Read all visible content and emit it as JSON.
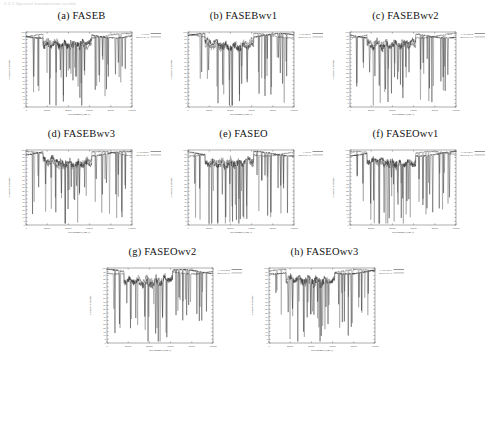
{
  "page_header": "2.2.2  Spectral transmission results",
  "figure": {
    "rows": [
      [
        "a",
        "b",
        "c"
      ],
      [
        "d",
        "e",
        "f"
      ],
      [
        "g",
        "h"
      ]
    ]
  },
  "panels": [
    {
      "id": "a",
      "caption": "(a) FASEB",
      "letter": "(a)",
      "name": "FASEB",
      "legend": [
        {
          "label": "FASEB",
          "color": "#2b2b2b"
        },
        {
          "label": "MODTRAN",
          "color": "#6e6e6e"
        }
      ]
    },
    {
      "id": "b",
      "caption": "(b) FASEBwv1",
      "letter": "(b)",
      "name": "FASEBwv1",
      "legend": [
        {
          "label": "FASEBwv1",
          "color": "#2b2b2b"
        },
        {
          "label": "MODTRAN",
          "color": "#6e6e6e"
        }
      ]
    },
    {
      "id": "c",
      "caption": "(c) FASEBwv2",
      "letter": "(c)",
      "name": "FASEBwv2",
      "legend": [
        {
          "label": "FASEBwv2",
          "color": "#2b2b2b"
        },
        {
          "label": "MODTRAN",
          "color": "#6e6e6e"
        }
      ]
    },
    {
      "id": "d",
      "caption": "(d) FASEBwv3",
      "letter": "(d)",
      "name": "FASEBwv3",
      "legend": [
        {
          "label": "FASEBwv3",
          "color": "#2b2b2b"
        },
        {
          "label": "MODTRAN",
          "color": "#6e6e6e"
        }
      ]
    },
    {
      "id": "e",
      "caption": "(e) FASEO",
      "letter": "(e)",
      "name": "FASEO",
      "legend": [
        {
          "label": "FASEO",
          "color": "#2b2b2b"
        },
        {
          "label": "MODTRAN",
          "color": "#6e6e6e"
        }
      ]
    },
    {
      "id": "f",
      "caption": "(f) FASEOwv1",
      "letter": "(f)",
      "name": "FASEOwv1",
      "legend": [
        {
          "label": "FASEOwv1",
          "color": "#2b2b2b"
        },
        {
          "label": "MODTRAN",
          "color": "#6e6e6e"
        }
      ]
    },
    {
      "id": "g",
      "caption": "(g) FASEOwv2",
      "letter": "(g)",
      "name": "FASEOwv2",
      "legend": [
        {
          "label": "FASEOwv2",
          "color": "#2b2b2b"
        },
        {
          "label": "MODTRAN",
          "color": "#6e6e6e"
        }
      ]
    },
    {
      "id": "h",
      "caption": "(h) FASEOwv3",
      "letter": "(h)",
      "name": "FASEOwv3",
      "legend": [
        {
          "label": "FASEOwv3",
          "color": "#2b2b2b"
        },
        {
          "label": "MODTRAN",
          "color": "#6e6e6e"
        }
      ]
    }
  ],
  "chart_data": [
    {
      "type": "line",
      "panel": "a",
      "title": "(a) FASEB",
      "xlabel": "wavenumber (cm-1)",
      "ylabel": "% correct identified",
      "xlim": [
        0,
        100000
      ],
      "ylim": [
        0,
        100
      ],
      "xticks": [
        0,
        20000,
        40000,
        60000,
        80000,
        100000
      ],
      "xticklabels": [
        "0",
        "20000",
        "40000",
        "60000",
        "80000",
        "100000"
      ],
      "yticks": [
        0,
        5,
        10,
        15,
        20,
        25,
        30,
        35,
        40,
        45,
        50,
        55,
        60,
        65,
        70,
        75,
        80,
        85,
        90,
        95,
        100
      ],
      "yticklabels": [
        "0",
        "5",
        "10",
        "15",
        "20",
        "25",
        "30",
        "35",
        "40",
        "45",
        "50",
        "55",
        "60",
        "65",
        "70",
        "75",
        "80",
        "85",
        "90",
        "95",
        "100"
      ],
      "grid": false,
      "legend_position": "top-right-outside",
      "series": [
        {
          "name": "FASEB",
          "color": "#2b2b2b",
          "x": [
            0,
            1500,
            3000,
            4500,
            6000,
            7000,
            7600,
            8200,
            9000,
            10200,
            11500,
            12600,
            13400,
            14200,
            15000,
            15600,
            16200,
            17000,
            17800,
            18600,
            19400,
            20200,
            21000,
            21800,
            22600,
            23400,
            24200,
            25000,
            25800,
            26600,
            27400,
            28200,
            29000,
            29800,
            30600,
            31400,
            32200,
            33000,
            33800,
            34600,
            35400,
            36200,
            37000,
            37800,
            38600,
            39400,
            40200,
            41000,
            41800,
            42600,
            43400,
            44200,
            45000,
            45800,
            46600,
            47400,
            48200,
            49000,
            49800,
            50600,
            51400,
            52200,
            53000,
            53800,
            54600,
            55400,
            56200,
            57000,
            57800,
            58600,
            59400,
            60200,
            61000,
            61800,
            62600,
            63400,
            64200,
            65000,
            65800,
            66600,
            67400,
            68200,
            69000,
            69800,
            70600,
            71400,
            72200,
            73000,
            73800,
            74600,
            75400,
            76200,
            77000,
            77800,
            78600,
            79400,
            80200,
            81000,
            81800,
            82600,
            83400,
            84200,
            85000,
            85800,
            86600,
            87400,
            88200,
            89000,
            89800,
            90600,
            91400,
            92200,
            93000,
            93800,
            94600,
            95400,
            96200,
            97000,
            97800,
            98600,
            99400,
            100000
          ],
          "y": [
            100,
            99,
            98,
            99,
            97,
            99,
            98,
            99,
            97,
            92,
            98,
            97,
            40,
            71,
            97,
            96,
            68,
            95,
            95,
            96,
            30,
            88,
            93,
            94,
            91,
            88,
            92,
            90,
            86,
            88,
            91,
            89,
            85,
            87,
            90,
            91,
            88,
            90,
            86,
            89,
            91,
            88,
            83,
            90,
            89,
            85,
            62,
            88,
            40,
            86,
            33,
            84,
            55,
            82,
            41,
            80,
            36,
            78,
            49,
            76,
            34,
            80,
            30,
            83,
            45,
            85,
            56,
            84,
            70,
            86,
            80,
            88,
            81,
            84,
            80,
            90,
            92,
            94,
            93,
            95,
            94,
            96,
            95,
            97,
            96,
            97,
            98,
            96,
            97,
            95,
            60,
            92,
            30,
            94,
            38,
            96,
            95,
            97,
            96,
            98,
            97,
            98,
            96,
            97,
            95,
            96,
            94,
            95,
            96,
            97,
            96,
            98,
            97,
            98,
            96,
            97,
            98,
            99,
            98,
            99,
            98,
            99
          ]
        },
        {
          "name": "MODTRAN",
          "color": "#6e6e6e",
          "x": [
            0,
            2000,
            4000,
            6000,
            8000,
            10000,
            12000,
            13400,
            15000,
            16200,
            18000,
            20200,
            22000,
            24000,
            26000,
            28000,
            30000,
            32000,
            34000,
            36000,
            38000,
            40200,
            42000,
            43400,
            45000,
            46600,
            48200,
            50000,
            51400,
            53000,
            54600,
            56200,
            58000,
            60000,
            62000,
            64000,
            66000,
            68000,
            70000,
            72000,
            74000,
            76000,
            78000,
            80200,
            81800,
            83400,
            85000,
            87000,
            89000,
            91000,
            93000,
            95000,
            97000,
            99000,
            100000
          ],
          "y": [
            100,
            99,
            98,
            97,
            98,
            96,
            97,
            44,
            96,
            72,
            95,
            34,
            93,
            91,
            88,
            89,
            90,
            88,
            89,
            89,
            84,
            66,
            87,
            44,
            56,
            45,
            40,
            50,
            38,
            34,
            49,
            60,
            72,
            82,
            80,
            91,
            93,
            94,
            95,
            96,
            97,
            96,
            97,
            64,
            34,
            42,
            95,
            96,
            95,
            96,
            95,
            96,
            97,
            98,
            99
          ]
        }
      ]
    },
    {
      "type": "line",
      "panel": "b",
      "title": "(b) FASEBwv1",
      "xlabel": "wavenumber (cm-1)",
      "ylabel": "% correct identified",
      "xlim": [
        0,
        100000
      ],
      "ylim": [
        0,
        100
      ],
      "xticks": [
        0,
        20000,
        40000,
        60000,
        80000,
        100000
      ],
      "xticklabels": [
        "0",
        "20000",
        "40000",
        "60000",
        "80000",
        "100000"
      ],
      "grid": false,
      "legend_position": "top-right-outside",
      "series": [
        {
          "name": "FASEBwv1",
          "color": "#2b2b2b"
        },
        {
          "name": "MODTRAN",
          "color": "#6e6e6e"
        }
      ]
    },
    {
      "type": "line",
      "panel": "c",
      "title": "(c) FASEBwv2",
      "xlabel": "wavenumber (cm-1)",
      "ylabel": "% correct identified",
      "xlim": [
        0,
        100000
      ],
      "ylim": [
        0,
        100
      ],
      "xticks": [
        0,
        20000,
        40000,
        60000,
        80000,
        100000
      ],
      "xticklabels": [
        "0",
        "20000",
        "40000",
        "60000",
        "80000",
        "100000"
      ],
      "grid": false,
      "legend_position": "top-right-outside",
      "series": [
        {
          "name": "FASEBwv2",
          "color": "#2b2b2b"
        },
        {
          "name": "MODTRAN",
          "color": "#6e6e6e"
        }
      ]
    },
    {
      "type": "line",
      "panel": "d",
      "title": "(d) FASEBwv3",
      "xlabel": "wavenumber (cm-1)",
      "ylabel": "% correct identified",
      "xlim": [
        0,
        100000
      ],
      "ylim": [
        0,
        100
      ],
      "xticks": [
        0,
        20000,
        40000,
        60000,
        80000,
        100000
      ],
      "xticklabels": [
        "0",
        "20000",
        "40000",
        "60000",
        "80000",
        "100000"
      ],
      "grid": false,
      "legend_position": "top-right-outside",
      "series": [
        {
          "name": "FASEBwv3",
          "color": "#2b2b2b"
        },
        {
          "name": "MODTRAN",
          "color": "#6e6e6e"
        }
      ]
    },
    {
      "type": "line",
      "panel": "e",
      "title": "(e) FASEO",
      "xlabel": "wavenumber (cm-1)",
      "ylabel": "% correct identified",
      "xlim": [
        0,
        100000
      ],
      "ylim": [
        0,
        100
      ],
      "xticks": [
        0,
        20000,
        40000,
        60000,
        80000,
        100000
      ],
      "xticklabels": [
        "0",
        "20000",
        "40000",
        "60000",
        "80000",
        "100000"
      ],
      "grid": false,
      "legend_position": "top-right-outside",
      "series": [
        {
          "name": "FASEO",
          "color": "#2b2b2b"
        },
        {
          "name": "MODTRAN",
          "color": "#6e6e6e"
        }
      ]
    },
    {
      "type": "line",
      "panel": "f",
      "title": "(f) FASEOwv1",
      "xlabel": "wavenumber (cm-1)",
      "ylabel": "% correct identified",
      "xlim": [
        0,
        100000
      ],
      "ylim": [
        0,
        100
      ],
      "xticks": [
        0,
        20000,
        40000,
        60000,
        80000,
        100000
      ],
      "xticklabels": [
        "0",
        "20000",
        "40000",
        "60000",
        "80000",
        "100000"
      ],
      "grid": false,
      "legend_position": "top-right-outside",
      "series": [
        {
          "name": "FASEOwv1",
          "color": "#2b2b2b"
        },
        {
          "name": "MODTRAN",
          "color": "#6e6e6e"
        }
      ]
    },
    {
      "type": "line",
      "panel": "g",
      "title": "(g) FASEOwv2",
      "xlabel": "wavenumber (cm-1)",
      "ylabel": "% correct identified",
      "xlim": [
        0,
        100000
      ],
      "ylim": [
        0,
        100
      ],
      "xticks": [
        0,
        20000,
        40000,
        60000,
        80000,
        100000
      ],
      "xticklabels": [
        "0",
        "20000",
        "40000",
        "60000",
        "80000",
        "100000"
      ],
      "grid": false,
      "legend_position": "top-right-outside",
      "series": [
        {
          "name": "FASEOwv2",
          "color": "#2b2b2b"
        },
        {
          "name": "MODTRAN",
          "color": "#6e6e6e"
        }
      ]
    },
    {
      "type": "line",
      "panel": "h",
      "title": "(h) FASEOwv3",
      "xlabel": "wavenumber (cm-1)",
      "ylabel": "% correct identified",
      "xlim": [
        0,
        100000
      ],
      "ylim": [
        0,
        100
      ],
      "xticks": [
        0,
        20000,
        40000,
        60000,
        80000,
        100000
      ],
      "xticklabels": [
        "0",
        "20000",
        "40000",
        "60000",
        "80000",
        "100000"
      ],
      "grid": false,
      "legend_position": "top-right-outside",
      "series": [
        {
          "name": "FASEOwv3",
          "color": "#2b2b2b"
        },
        {
          "name": "MODTRAN",
          "color": "#6e6e6e"
        }
      ]
    }
  ]
}
